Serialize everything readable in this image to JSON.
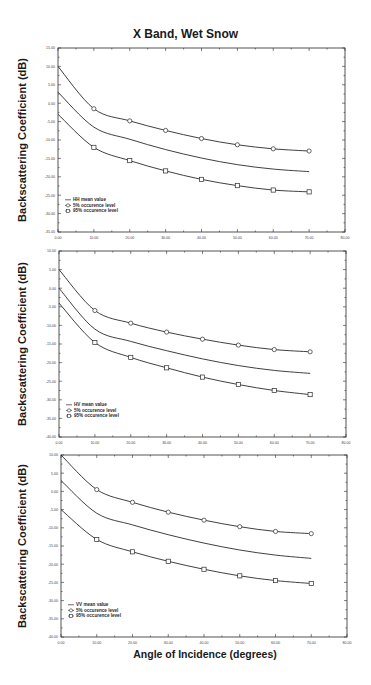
{
  "figure": {
    "title": "X Band, Wet Snow",
    "xlabel": "Angle of Incidence (degrees)"
  },
  "chart_data": [
    {
      "type": "line",
      "title": "HH",
      "xlabel": "Angle of Incidence (degrees)",
      "ylabel": "Backscattering Coefficient (dB)",
      "xlim": [
        0,
        80
      ],
      "ylim": [
        -35,
        15
      ],
      "x_ticks": [
        "0.00",
        "10.00",
        "20.00",
        "30.00",
        "40.00",
        "50.00",
        "60.00",
        "70.00",
        "80.00"
      ],
      "y_ticks": [
        "15.00",
        "10.00",
        "5.00",
        "0.00",
        "-5.00",
        "-10.00",
        "-15.00",
        "-20.00",
        "-25.00",
        "-30.00",
        "-35.00"
      ],
      "grid": false,
      "legend_position": "lower left",
      "x": [
        0,
        10,
        20,
        30,
        40,
        50,
        60,
        70
      ],
      "series": [
        {
          "name": "HH mean value",
          "marker": "none",
          "values": [
            3.0,
            -6.5,
            -9.8,
            -12.6,
            -14.9,
            -16.7,
            -17.9,
            -18.6
          ]
        },
        {
          "name": "5% occurence level",
          "marker": "circle",
          "values": [
            10.0,
            -1.5,
            -4.8,
            -7.4,
            -9.6,
            -11.3,
            -12.4,
            -13.0
          ]
        },
        {
          "name": "95% occurence level",
          "marker": "square",
          "values": [
            -3.0,
            -12.0,
            -15.6,
            -18.4,
            -20.7,
            -22.4,
            -23.6,
            -24.1
          ]
        }
      ]
    },
    {
      "type": "line",
      "title": "HV",
      "xlabel": "Angle of Incidence (degrees)",
      "ylabel": "Backscattering Coefficient (dB)",
      "xlim": [
        0,
        80
      ],
      "ylim": [
        -40,
        10
      ],
      "x_ticks": [
        "0.00",
        "10.00",
        "20.00",
        "30.00",
        "40.00",
        "50.00",
        "60.00",
        "70.00",
        "80.00"
      ],
      "y_ticks": [
        "10.00",
        "5.00",
        "0.00",
        "-5.00",
        "-10.00",
        "-15.00",
        "-20.00",
        "-25.00",
        "-30.00",
        "-35.00",
        "-40.00"
      ],
      "grid": false,
      "legend_position": "lower left",
      "x": [
        0,
        10,
        20,
        30,
        40,
        50,
        60,
        70
      ],
      "series": [
        {
          "name": "HV mean value",
          "marker": "none",
          "values": [
            0.0,
            -11.0,
            -14.3,
            -16.8,
            -19.0,
            -20.8,
            -22.1,
            -22.9
          ]
        },
        {
          "name": "5% occurence level",
          "marker": "circle",
          "values": [
            5.0,
            -6.0,
            -9.4,
            -11.8,
            -13.7,
            -15.3,
            -16.5,
            -17.1
          ]
        },
        {
          "name": "95% occurence level",
          "marker": "square",
          "values": [
            -4.0,
            -14.6,
            -18.6,
            -21.4,
            -23.9,
            -25.9,
            -27.5,
            -28.6
          ]
        }
      ]
    },
    {
      "type": "line",
      "title": "VV",
      "xlabel": "Angle of Incidence (degrees)",
      "ylabel": "Backscattering Coefficient (dB)",
      "xlim": [
        0,
        80
      ],
      "ylim": [
        -40,
        10
      ],
      "x_ticks": [
        "0.00",
        "10.00",
        "20.00",
        "30.00",
        "40.00",
        "50.00",
        "60.00",
        "70.00",
        "80.00"
      ],
      "y_ticks": [
        "10.00",
        "5.00",
        "0.00",
        "-5.00",
        "-10.00",
        "-15.00",
        "-20.00",
        "-25.00",
        "-30.00",
        "-35.00",
        "-40.00"
      ],
      "grid": false,
      "legend_position": "lower left",
      "x": [
        0,
        10,
        20,
        30,
        40,
        50,
        60,
        70
      ],
      "series": [
        {
          "name": "VV mean value",
          "marker": "none",
          "values": [
            3.0,
            -6.0,
            -9.2,
            -11.9,
            -14.2,
            -16.1,
            -17.5,
            -18.4
          ]
        },
        {
          "name": "5% occurence level",
          "marker": "circle",
          "values": [
            10.0,
            0.5,
            -3.0,
            -5.7,
            -7.9,
            -9.7,
            -11.0,
            -11.6
          ]
        },
        {
          "name": "95% occurence level",
          "marker": "square",
          "values": [
            -5.0,
            -13.2,
            -16.6,
            -19.2,
            -21.4,
            -23.2,
            -24.5,
            -25.3
          ]
        }
      ]
    }
  ],
  "panels": [
    {
      "box": [
        58,
        48,
        345,
        232
      ],
      "legend": [
        "HH mean value",
        "5% occurence level",
        "95% occurence level"
      ]
    },
    {
      "box": [
        59,
        251,
        346,
        437
      ],
      "legend": [
        "HV mean value",
        "5% occurence level",
        "95% occurence level"
      ]
    },
    {
      "box": [
        61,
        455,
        347,
        637
      ],
      "legend": [
        "VV mean value",
        "5% occurence level",
        "95% occurence level"
      ]
    }
  ]
}
